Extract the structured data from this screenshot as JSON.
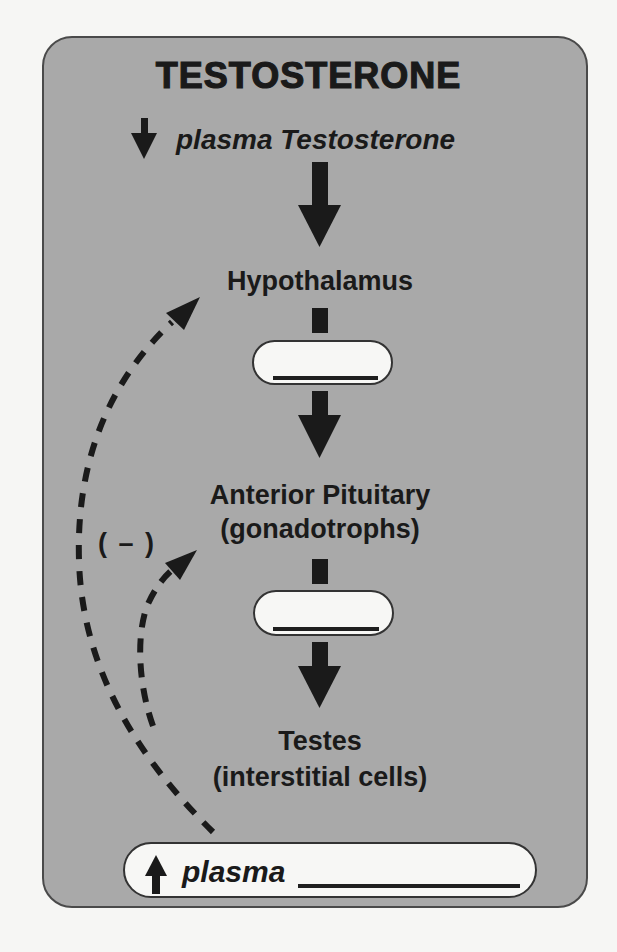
{
  "diagram": {
    "title": "TESTOSTERONE",
    "trigger": {
      "direction_icon": "down-arrow-icon",
      "text": "plasma Testosterone"
    },
    "nodes": [
      {
        "id": "hypothalamus",
        "label": "Hypothalamus",
        "sublabel": ""
      },
      {
        "id": "anterior-pituitary",
        "label": "Anterior Pituitary",
        "sublabel": "(gonadotrophs)"
      },
      {
        "id": "testes",
        "label": "Testes",
        "sublabel": "(interstitial cells)"
      }
    ],
    "hormone_blanks": [
      {
        "between": "hypothalamus → anterior-pituitary",
        "value": ""
      },
      {
        "between": "anterior-pituitary → testes",
        "value": ""
      }
    ],
    "feedback": {
      "label": "( – )",
      "type": "negative",
      "targets": [
        "hypothalamus",
        "anterior-pituitary"
      ],
      "style": "dashed"
    },
    "result": {
      "direction_icon": "up-arrow-icon",
      "text": "plasma",
      "blank_value": ""
    },
    "colors": {
      "panel_fill": "#a9a9a9",
      "panel_border": "#4a4a4a",
      "background": "#f6f6f4",
      "pill_fill": "#f7f7f5",
      "ink": "#1a1a1a"
    }
  }
}
